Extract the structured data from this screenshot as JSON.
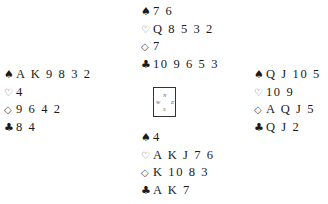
{
  "suit_symbols": {
    "spades": "♠",
    "hearts": "♡",
    "diamonds": "◇",
    "clubs": "♣"
  },
  "compass": {
    "north": "N",
    "west": "W",
    "east": "E",
    "south": "S"
  },
  "hands": {
    "north": {
      "spades": "7 6",
      "hearts": "Q 8 5 3 2",
      "diamonds": "7",
      "clubs": "10 9 6 5 3"
    },
    "west": {
      "spades": "A K 9 8 3 2",
      "hearts": "4",
      "diamonds": "9 6 4 2",
      "clubs": "8 4"
    },
    "east": {
      "spades": "Q J 10 5",
      "hearts": "10 9",
      "diamonds": "A Q J 5",
      "clubs": "Q J 2"
    },
    "south": {
      "spades": "4",
      "hearts": "A K J 7 6",
      "diamonds": "K 10 8 3",
      "clubs": "A K 7"
    }
  }
}
